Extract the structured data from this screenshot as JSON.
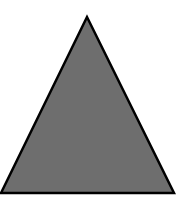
{
  "diagram": {
    "shape": "triangle",
    "background_color": "#ffffff",
    "fill_color": "#6e6e6e",
    "stroke_color": "#000000",
    "stroke_width": 2.5,
    "vertices": {
      "apex": [
        87,
        17
      ],
      "bottom_left": [
        1,
        193
      ],
      "bottom_right": [
        174,
        193
      ]
    }
  }
}
